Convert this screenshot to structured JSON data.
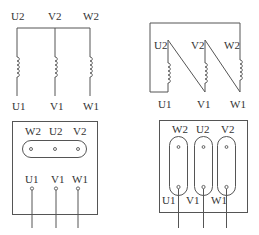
{
  "diagram": {
    "star_connection": {
      "top_labels": [
        "U2",
        "V2",
        "W2"
      ],
      "bottom_labels": [
        "U1",
        "V1",
        "W1"
      ]
    },
    "delta_connection": {
      "top_labels": [
        "U2",
        "V2",
        "W2"
      ],
      "bottom_labels": [
        "U1",
        "V1",
        "W1"
      ]
    },
    "star_terminal_box": {
      "top_labels": [
        "W2",
        "U2",
        "V2"
      ],
      "bottom_labels": [
        "U1",
        "V1",
        "W1"
      ]
    },
    "delta_terminal_box": {
      "top_labels": [
        "W2",
        "U2",
        "V2"
      ],
      "bottom_labels": [
        "U1",
        "V1",
        "W1"
      ]
    },
    "colors": {
      "line": "#555555",
      "text": "#333333",
      "background": "#ffffff"
    }
  }
}
